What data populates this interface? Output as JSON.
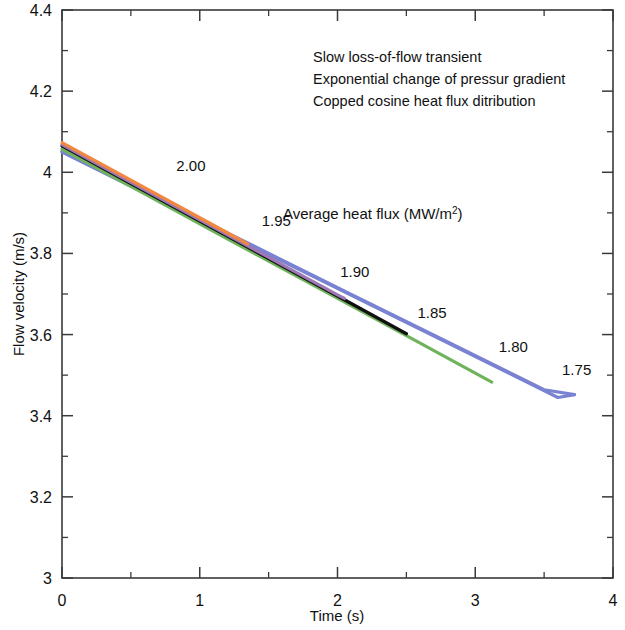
{
  "chart_data": {
    "type": "line",
    "title": "",
    "xlabel": "Time (s)",
    "ylabel": "Flow velocity (m/s)",
    "xlim": [
      0,
      4
    ],
    "ylim": [
      3,
      4.4
    ],
    "x_major_ticks": [
      "0",
      "1",
      "2",
      "3",
      "4"
    ],
    "x_major_values": [
      0,
      1,
      2,
      3,
      4
    ],
    "x_minor_values": [
      0.5,
      1.5,
      2.5,
      3.5
    ],
    "y_major_ticks": [
      "3",
      "3.2",
      "3.4",
      "3.6",
      "3.8",
      "4",
      "4.2",
      "4.4"
    ],
    "y_major_values": [
      3,
      3.2,
      3.4,
      3.6,
      3.8,
      4,
      4.2,
      4.4
    ],
    "y_minor_values": [
      3.1,
      3.3,
      3.5,
      3.7,
      3.9,
      4.1,
      4.3
    ],
    "grid": false,
    "legend_position": "inline-curve-labels",
    "legend_title": "Average heat flux (MW/m²)",
    "annotations": [
      "Slow loss-of-flow transient",
      "Exponential change of pressur gradient",
      "Copped cosine heat flux ditribution"
    ],
    "series": [
      {
        "name": "2.00",
        "label": "2.00",
        "color": "#f2883f",
        "x": [
          0,
          0.2,
          0.4,
          0.6,
          0.8,
          1.0,
          1.2,
          1.35
        ],
        "y": [
          4.073,
          4.036,
          3.999,
          3.962,
          3.925,
          3.888,
          3.851,
          3.823
        ]
      },
      {
        "name": "1.95",
        "label": "1.95",
        "color": "#9d78b5",
        "x": [
          0,
          0.4,
          0.8,
          1.2,
          1.6,
          2.0,
          2.05
        ],
        "y": [
          4.068,
          3.994,
          3.92,
          3.846,
          3.772,
          3.698,
          3.689
        ]
      },
      {
        "name": "1.90",
        "label": "1.90",
        "color": "#101010",
        "x": [
          0,
          0.5,
          1.0,
          1.5,
          2.0,
          2.5
        ],
        "y": [
          4.065,
          3.972,
          3.88,
          3.787,
          3.695,
          3.602
        ]
      },
      {
        "name": "1.85",
        "label": "1.85",
        "color": "#6fb35c",
        "x": [
          0,
          0.6,
          1.2,
          1.8,
          2.4,
          3.0,
          3.12
        ],
        "y": [
          4.057,
          3.947,
          3.836,
          3.726,
          3.616,
          3.505,
          3.483
        ]
      },
      {
        "name": "1.80",
        "label": "1.80",
        "color": "#7a83d1",
        "x": [
          0,
          0.7,
          1.4,
          2.1,
          2.8,
          3.5,
          3.72
        ],
        "y": [
          4.052,
          3.934,
          3.817,
          3.699,
          3.582,
          3.464,
          3.452
        ]
      },
      {
        "name": "1.75",
        "label": "1.75",
        "color": "#7a83d1",
        "x": [
          0,
          0.9,
          1.8,
          2.7,
          3.6,
          3.72
        ],
        "y": [
          4.05,
          3.898,
          3.747,
          3.596,
          3.445,
          3.452
        ]
      }
    ],
    "curve_labels": [
      {
        "text": "2.00",
        "x": 0.83,
        "y": 4.003
      },
      {
        "text": "1.95",
        "x": 1.45,
        "y": 3.868
      },
      {
        "text": "1.90",
        "x": 2.02,
        "y": 3.742
      },
      {
        "text": "1.85",
        "x": 2.58,
        "y": 3.64
      },
      {
        "text": "1.80",
        "x": 3.17,
        "y": 3.558
      },
      {
        "text": "1.75",
        "x": 3.63,
        "y": 3.5
      }
    ]
  },
  "axes": {
    "y_title": "Flow velocity (m/s)",
    "x_title": "Time (s)"
  },
  "notes": {
    "line1": "Slow loss-of-flow transient",
    "line2": "Exponential change of pressur gradient",
    "line3": "Copped cosine heat flux ditribution"
  },
  "legend": {
    "title_main": "Average heat flux (MW/m",
    "title_sup": "2",
    "title_tail": ")"
  },
  "colors": {
    "axis": "#3a3a3a",
    "text": "#111111",
    "series_200": "#f2883f",
    "series_195": "#9d78b5",
    "series_190": "#101010",
    "series_185": "#6fb35c",
    "series_180": "#7a83d1",
    "background": "#ffffff"
  }
}
